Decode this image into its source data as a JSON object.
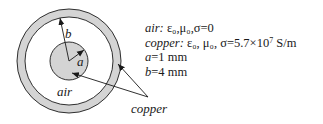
{
  "diagram": {
    "type": "coaxial cross-section",
    "labels": {
      "b": "b",
      "a": "a",
      "air": "air",
      "copper": "copper"
    },
    "colors": {
      "conductor_fill": "#d4d4d4",
      "stroke": "#1a1a1a"
    }
  },
  "properties": {
    "air": {
      "name": "air:",
      "values": "ε₀,μ₀,σ=0"
    },
    "copper": {
      "name": "copper:",
      "values_pre": "ε₀, μ₀, σ=5.7×10",
      "exponent": "7",
      "unit": " S/m"
    },
    "a": {
      "symbol": "a",
      "value": "=1 mm"
    },
    "b": {
      "symbol": "b",
      "value": "=4 mm"
    }
  }
}
